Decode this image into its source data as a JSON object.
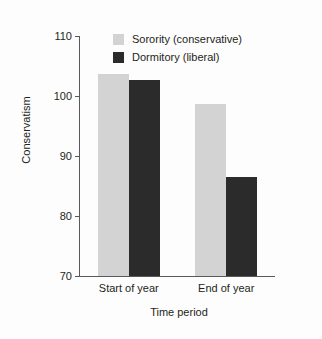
{
  "chart_data": {
    "type": "bar",
    "title": "",
    "xlabel": "Time period",
    "ylabel": "Conservatism",
    "categories": [
      "Start of year",
      "End of year"
    ],
    "series": [
      {
        "name": "Sorority (conservative)",
        "color": "#d3d3d3",
        "values": [
          103.7,
          98.7
        ]
      },
      {
        "name": "Dormitory (liberal)",
        "color": "#2b2b2b",
        "values": [
          102.7,
          86.5
        ]
      }
    ],
    "ylim": [
      70,
      110
    ],
    "yticks": [
      70,
      80,
      90,
      100,
      110
    ],
    "ytick_labels": [
      "70",
      "80",
      "90",
      "100",
      "110"
    ],
    "grid": false,
    "legend_position": "top-center"
  }
}
